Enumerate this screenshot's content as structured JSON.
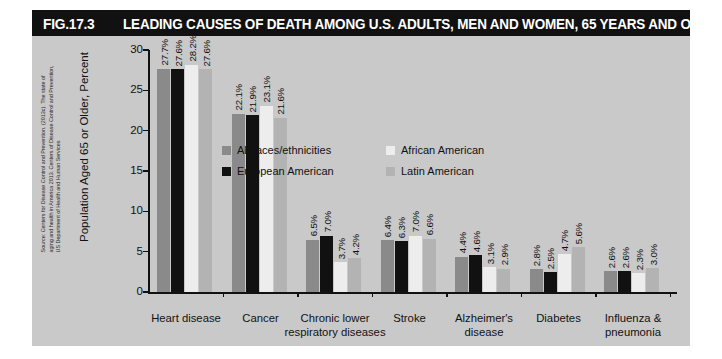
{
  "figure": {
    "number": "FIG.17.3",
    "title": "LEADING CAUSES OF DEATH AMONG U.S. ADULTS, MEN AND WOMEN, 65 YEARS AND OVER",
    "source": "Source: Centers for Disease Control and Prevention. (2013c). The state of aging and health in America 2013. Centers of Disease Control and Prevention, US Department of Health and Human Services",
    "colors": {
      "title_bar_bg": "#111111",
      "title_text": "#ffffff",
      "panel_bg": "#c9c9c9",
      "series_all_races": "#8a8a8a",
      "series_african_american": "#ededed",
      "series_european_american": "#111111",
      "series_latin_american": "#b3b3b3"
    }
  },
  "chart_data": {
    "type": "bar",
    "title": "LEADING CAUSES OF DEATH AMONG U.S. ADULTS, MEN AND WOMEN, 65 YEARS AND OVER",
    "xlabel": "",
    "ylabel": "Population Aged 65 or Older, Percent",
    "ylim": [
      0,
      30
    ],
    "yticks": [
      "0",
      "5",
      "10",
      "15",
      "20",
      "25",
      "30"
    ],
    "grid": false,
    "legend_position": "upper-center",
    "categories": [
      "Heart disease",
      "Cancer",
      "Chronic lower\nrespiratory diseases",
      "Stroke",
      "Alzheimer's\ndisease",
      "Diabetes",
      "Influenza &\npneumonia"
    ],
    "category_lines": [
      [
        "Heart disease"
      ],
      [
        "Cancer"
      ],
      [
        "Chronic lower",
        "respiratory diseases"
      ],
      [
        "Stroke"
      ],
      [
        "Alzheimer's",
        "disease"
      ],
      [
        "Diabetes"
      ],
      [
        "Influenza &",
        "pneumonia"
      ]
    ],
    "series": [
      {
        "name": "All races/ethnicities",
        "color": "#8a8a8a",
        "values": [
          27.7,
          22.1,
          6.5,
          6.4,
          4.4,
          2.8,
          2.6
        ],
        "labels": [
          "27.7%",
          "22.1%",
          "6.5%",
          "6.4%",
          "4.4%",
          "2.8%",
          "2.6%"
        ]
      },
      {
        "name": "European American",
        "color": "#111111",
        "values": [
          27.6,
          21.9,
          7.0,
          6.3,
          4.6,
          2.5,
          2.6
        ],
        "labels": [
          "27.6%",
          "21.9%",
          "7.0%",
          "6.3%",
          "4.6%",
          "2.5%",
          "2.6%"
        ]
      },
      {
        "name": "African American",
        "color": "#ededed",
        "values": [
          28.2,
          23.1,
          3.7,
          7.0,
          3.1,
          4.7,
          2.3
        ],
        "labels": [
          "28.2%",
          "23.1%",
          "3.7%",
          "7.0%",
          "3.1%",
          "4.7%",
          "2.3%"
        ]
      },
      {
        "name": "Latin American",
        "color": "#b3b3b3",
        "values": [
          27.6,
          21.6,
          4.2,
          6.6,
          2.9,
          5.6,
          3.0
        ],
        "labels": [
          "27.6%",
          "21.6%",
          "4.2%",
          "6.6%",
          "2.9%",
          "5.6%",
          "3.0%"
        ]
      }
    ]
  },
  "legend": {
    "entries": [
      {
        "label": "All races/ethnicities",
        "color": "#8a8a8a"
      },
      {
        "label": "African American",
        "color": "#ededed"
      },
      {
        "label": "European American",
        "color": "#111111"
      },
      {
        "label": "Latin American",
        "color": "#b3b3b3"
      }
    ]
  }
}
